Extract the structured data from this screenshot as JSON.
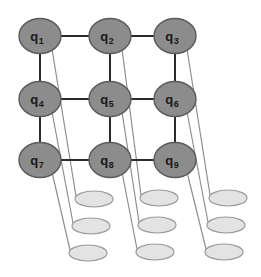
{
  "figure": {
    "background_color": "#ffffff",
    "width": 261,
    "height": 277
  },
  "style": {
    "qubit_fill": "#8c8c8c",
    "qubit_stroke": "#5a5a5a",
    "qubit_stroke_width": 1.4,
    "qubit_rx": 21,
    "qubit_ry": 17.5,
    "label_color": "#1a1a1a",
    "lattice_edge_color": "#2b2b2b",
    "lattice_edge_width": 2.0,
    "readout_fill": "#e3e3e3",
    "readout_stroke": "#9a9a9a",
    "readout_stroke_width": 1.2,
    "readout_rx": 19,
    "readout_ry": 8,
    "connector_color": "#8f8f8f",
    "connector_width": 1.2
  },
  "qubits": [
    {
      "id": "q1",
      "label": "q",
      "subscript": "1",
      "x": 40,
      "y": 36,
      "row": 0,
      "col": 0
    },
    {
      "id": "q2",
      "label": "q",
      "subscript": "2",
      "x": 110,
      "y": 36,
      "row": 0,
      "col": 1
    },
    {
      "id": "q3",
      "label": "q",
      "subscript": "3",
      "x": 175,
      "y": 36,
      "row": 0,
      "col": 2
    },
    {
      "id": "q4",
      "label": "q",
      "subscript": "4",
      "x": 40,
      "y": 99,
      "row": 1,
      "col": 0
    },
    {
      "id": "q5",
      "label": "q",
      "subscript": "5",
      "x": 110,
      "y": 99,
      "row": 1,
      "col": 1
    },
    {
      "id": "q6",
      "label": "q",
      "subscript": "6",
      "x": 175,
      "y": 99,
      "row": 1,
      "col": 2
    },
    {
      "id": "q7",
      "label": "q",
      "subscript": "7",
      "x": 40,
      "y": 160,
      "row": 2,
      "col": 0
    },
    {
      "id": "q8",
      "label": "q",
      "subscript": "8",
      "x": 110,
      "y": 160,
      "row": 2,
      "col": 1
    },
    {
      "id": "q9",
      "label": "q",
      "subscript": "9",
      "x": 175,
      "y": 160,
      "row": 2,
      "col": 2
    }
  ],
  "lattice_edges": [
    {
      "from": "q1",
      "to": "q2",
      "orientation": "horizontal"
    },
    {
      "from": "q2",
      "to": "q3",
      "orientation": "horizontal"
    },
    {
      "from": "q4",
      "to": "q5",
      "orientation": "horizontal"
    },
    {
      "from": "q5",
      "to": "q6",
      "orientation": "horizontal"
    },
    {
      "from": "q7",
      "to": "q8",
      "orientation": "horizontal"
    },
    {
      "from": "q8",
      "to": "q9",
      "orientation": "horizontal"
    },
    {
      "from": "q1",
      "to": "q4",
      "orientation": "vertical"
    },
    {
      "from": "q2",
      "to": "q5",
      "orientation": "vertical"
    },
    {
      "from": "q3",
      "to": "q6",
      "orientation": "vertical"
    },
    {
      "from": "q4",
      "to": "q7",
      "orientation": "vertical"
    },
    {
      "from": "q5",
      "to": "q8",
      "orientation": "vertical"
    },
    {
      "from": "q6",
      "to": "q9",
      "orientation": "vertical"
    }
  ],
  "readouts": [
    {
      "id": "r1",
      "x": 94,
      "y": 199,
      "column": 0,
      "row": 0
    },
    {
      "id": "r4",
      "x": 91,
      "y": 226,
      "column": 0,
      "row": 1
    },
    {
      "id": "r7",
      "x": 88,
      "y": 253,
      "column": 0,
      "row": 2
    },
    {
      "id": "r2",
      "x": 159,
      "y": 198,
      "column": 1,
      "row": 0
    },
    {
      "id": "r5",
      "x": 157,
      "y": 225,
      "column": 1,
      "row": 1
    },
    {
      "id": "r8",
      "x": 155,
      "y": 252,
      "column": 1,
      "row": 2
    },
    {
      "id": "r3",
      "x": 228,
      "y": 198,
      "column": 2,
      "row": 0
    },
    {
      "id": "r6",
      "x": 226,
      "y": 225,
      "column": 2,
      "row": 1
    },
    {
      "id": "r9",
      "x": 224,
      "y": 252,
      "column": 2,
      "row": 2
    }
  ],
  "connectors": [
    {
      "from": "q1",
      "to": "r1",
      "x1": 52,
      "y1": 49,
      "x2": 76,
      "y2": 196
    },
    {
      "from": "q4",
      "to": "r4",
      "x1": 52,
      "y1": 112,
      "x2": 73,
      "y2": 223
    },
    {
      "from": "q7",
      "to": "r7",
      "x1": 52,
      "y1": 172,
      "x2": 70,
      "y2": 250
    },
    {
      "from": "q2",
      "to": "r2",
      "x1": 122,
      "y1": 49,
      "x2": 141,
      "y2": 195
    },
    {
      "from": "q5",
      "to": "r5",
      "x1": 122,
      "y1": 112,
      "x2": 139,
      "y2": 222
    },
    {
      "from": "q8",
      "to": "r8",
      "x1": 122,
      "y1": 172,
      "x2": 137,
      "y2": 249
    },
    {
      "from": "q3",
      "to": "r3",
      "x1": 187,
      "y1": 49,
      "x2": 210,
      "y2": 195
    },
    {
      "from": "q6",
      "to": "r6",
      "x1": 187,
      "y1": 112,
      "x2": 208,
      "y2": 222
    },
    {
      "from": "q9",
      "to": "r9",
      "x1": 187,
      "y1": 172,
      "x2": 206,
      "y2": 249
    }
  ]
}
